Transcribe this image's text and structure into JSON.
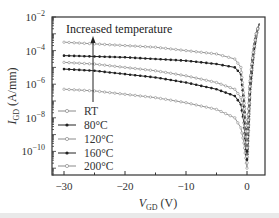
{
  "chart_data": {
    "type": "line",
    "title": "",
    "xlabel": "V_GD (V)",
    "xlabel_main": "V",
    "xlabel_sub": "GD",
    "xlabel_unit": " (V)",
    "ylabel": "I_GD (A/mm)",
    "ylabel_main": "I",
    "ylabel_sub": "GD",
    "ylabel_unit": " (A/mm)",
    "xlim": [
      -32,
      3
    ],
    "ylim_log10": [
      -11.4,
      -2
    ],
    "yscale": "log",
    "x_ticks": [
      -30,
      -20,
      -10,
      0
    ],
    "x_tick_labels": [
      "−30",
      "−20",
      "−10",
      "0"
    ],
    "y_ticks_log10": [
      -2,
      -4,
      -6,
      -8,
      -10
    ],
    "y_tick_labels": [
      {
        "base": "10",
        "exp": "−2"
      },
      {
        "base": "10",
        "exp": "−4"
      },
      {
        "base": "10",
        "exp": "−6"
      },
      {
        "base": "10",
        "exp": "−8"
      },
      {
        "base": "10",
        "exp": "−10"
      }
    ],
    "grid": false,
    "legend_position": "lower-left",
    "annotation": {
      "text": "Increased temperature",
      "arrow": "up"
    },
    "x": [
      -30,
      -25,
      -20,
      -15,
      -10,
      -5,
      -2,
      -1,
      -0.5,
      0,
      0.5,
      1,
      1.5,
      2
    ],
    "series": [
      {
        "name": "RT",
        "marker": "open",
        "log10_values": [
          -6.3,
          -6.4,
          -6.6,
          -6.8,
          -7.1,
          -7.5,
          -8.0,
          -8.6,
          -9.5,
          -11.0,
          -6.5,
          -4.5,
          -3.2,
          -2.4
        ]
      },
      {
        "name": "80°C",
        "marker": "filled",
        "log10_values": [
          -5.1,
          -5.2,
          -5.4,
          -5.6,
          -5.9,
          -6.3,
          -6.7,
          -7.2,
          -8.3,
          -10.5,
          -6.3,
          -4.4,
          -3.1,
          -2.4
        ]
      },
      {
        "name": "120°C",
        "marker": "open",
        "log10_values": [
          -4.7,
          -4.8,
          -5.0,
          -5.2,
          -5.5,
          -5.9,
          -6.3,
          -6.8,
          -8.0,
          -10.3,
          -6.1,
          -4.3,
          -3.1,
          -2.4
        ]
      },
      {
        "name": "160°C",
        "marker": "filled",
        "log10_values": [
          -4.3,
          -4.35,
          -4.4,
          -4.5,
          -4.6,
          -4.8,
          -5.0,
          -5.4,
          -7.0,
          -10.0,
          -5.9,
          -4.2,
          -3.0,
          -2.4
        ]
      },
      {
        "name": "200°C",
        "marker": "open",
        "log10_values": [
          -3.5,
          -3.6,
          -3.7,
          -3.8,
          -4.0,
          -4.2,
          -4.5,
          -5.0,
          -6.8,
          -9.8,
          -5.8,
          -4.1,
          -3.0,
          -2.4
        ]
      }
    ]
  }
}
